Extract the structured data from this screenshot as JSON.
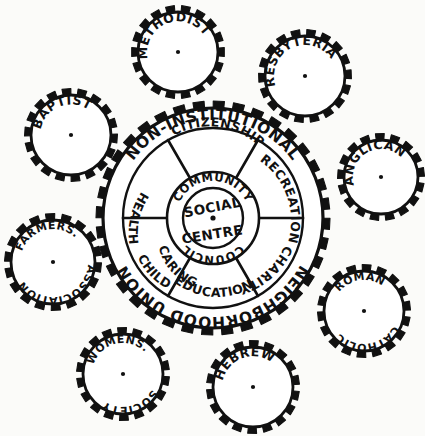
{
  "figure": {
    "ink_color": "#111111",
    "paper_color": "#fbfbf9"
  },
  "main_gear": {
    "name": "main-gear",
    "outer_ring_top_label": "NON-INSTITUTIONAL",
    "outer_ring_bottom_label": "NEIGHBORHOOD UNION",
    "teeth_count": 36,
    "sectors": [
      {
        "id": "citizenship",
        "label": "CITIZENSHIP",
        "angle_deg": -90
      },
      {
        "id": "recreation",
        "label": "RECREATION",
        "angle_deg": -30
      },
      {
        "id": "charity",
        "label": "CHARITY",
        "angle_deg": 30
      },
      {
        "id": "education",
        "label": "EDUCATION",
        "angle_deg": 90
      },
      {
        "id": "child-caring",
        "label": "CHILD CARING",
        "line1": "CHILD",
        "line2": "CARING",
        "angle_deg": 150
      },
      {
        "id": "health",
        "label": "HEALTH",
        "angle_deg": 210
      }
    ]
  },
  "hub": {
    "name": "social-centre-hub",
    "inner_line1": "SOCIAL",
    "inner_line2": "CENTRE",
    "ring_top_label": "COMMUNITY",
    "ring_bottom_label": "COUNCIL"
  },
  "satellite_gears": [
    {
      "id": "methodist",
      "label": "METHODIST",
      "line1": "METHODIST",
      "line2": "",
      "cx": 178,
      "cy": 52,
      "r": 40,
      "teeth": 18,
      "rotation_deg": -22
    },
    {
      "id": "presbyterian",
      "label": "PRESBYTERIAN",
      "line1": "PRESBYTERIAN",
      "line2": "",
      "cx": 305,
      "cy": 76,
      "r": 40,
      "teeth": 18,
      "rotation_deg": -24
    },
    {
      "id": "anglican",
      "label": "ANGLICAN",
      "line1": "ANGLICAN",
      "line2": "",
      "cx": 381,
      "cy": 177,
      "r": 37,
      "teeth": 17,
      "rotation_deg": -30
    },
    {
      "id": "roman-catholic",
      "label": "ROMAN CATHOLIC",
      "line1": "ROMAN",
      "line2": "CATHOLIC",
      "cx": 364,
      "cy": 311,
      "r": 40,
      "teeth": 18,
      "rotation_deg": -8
    },
    {
      "id": "hebrew",
      "label": "HEBREW",
      "line1": "HEBREW",
      "line2": "",
      "cx": 253,
      "cy": 387,
      "r": 40,
      "teeth": 18,
      "rotation_deg": -20
    },
    {
      "id": "womens-society",
      "label": "WOMENS SOCIETY",
      "line1": "WOMENS.",
      "line2": "SOCIETY",
      "cx": 123,
      "cy": 374,
      "r": 40,
      "teeth": 18,
      "rotation_deg": -14
    },
    {
      "id": "farmers-association",
      "label": "FARMERS ASSOCIATION",
      "line1": "FARMERS.",
      "line2": "ASSOCIATION",
      "cx": 53,
      "cy": 262,
      "r": 42,
      "teeth": 18,
      "rotation_deg": -14
    },
    {
      "id": "baptist",
      "label": "BAPTIST",
      "line1": "BAPTIST",
      "line2": "",
      "cx": 71,
      "cy": 135,
      "r": 40,
      "teeth": 18,
      "rotation_deg": -22
    }
  ]
}
